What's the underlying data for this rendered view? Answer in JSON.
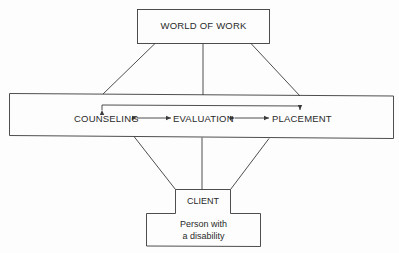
{
  "diagram": {
    "top_node": {
      "label": "WORLD OF WORK"
    },
    "process": {
      "steps": [
        {
          "label": "COUNSELING"
        },
        {
          "label": "EVALUATION"
        },
        {
          "label": "PLACEMENT"
        }
      ],
      "connections": [
        {
          "from": "COUNSELING",
          "to": "EVALUATION",
          "type": "bidirectional-arrow"
        },
        {
          "from": "EVALUATION",
          "to": "PLACEMENT",
          "type": "bidirectional-arrow"
        },
        {
          "from": "COUNSELING",
          "to": "PLACEMENT",
          "type": "bracket-arrow"
        }
      ]
    },
    "bottom_node": {
      "title": "CLIENT",
      "subtitle_line1": "Person with",
      "subtitle_line2": "a disability"
    },
    "colors": {
      "line": "#3a3a3a",
      "background": "#fdfdfd",
      "text": "#2a2a2a"
    }
  }
}
